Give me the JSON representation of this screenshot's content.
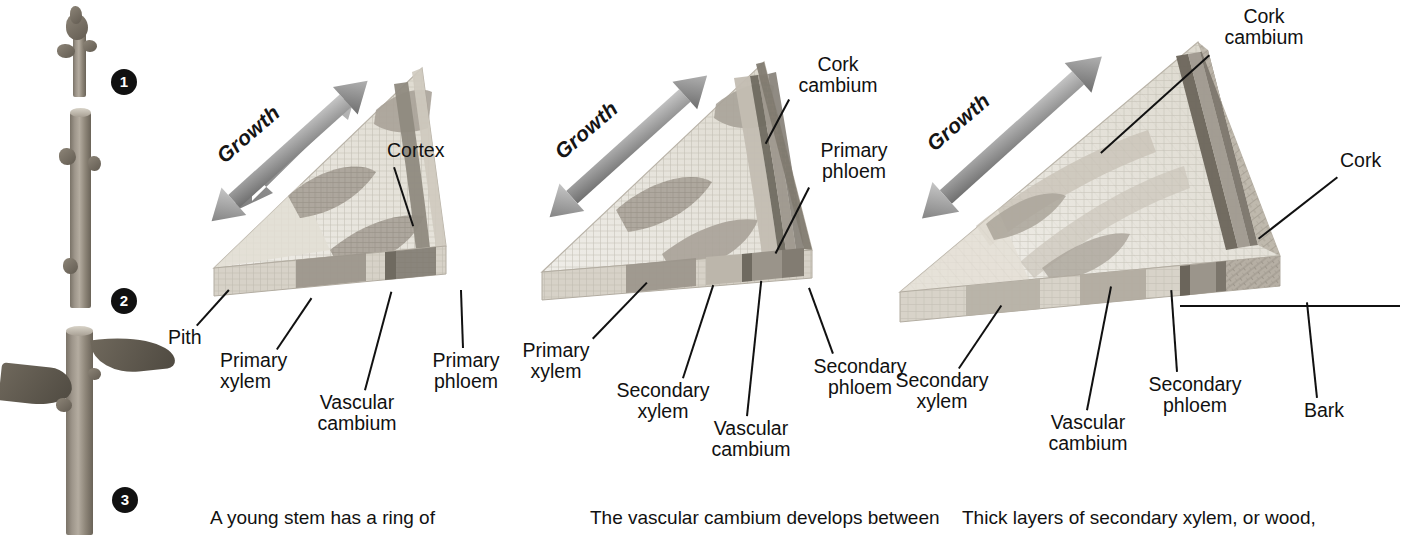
{
  "figure": {
    "palette": {
      "ink": "#111111",
      "arrow_gray": "#8a8a8a",
      "pith": "#d9d5cc",
      "primary_xylem": "#9a958b",
      "secondary_xylem": "#b3ada2",
      "vascular_cambium": "#6f6a60",
      "primary_phloem": "#8e8980",
      "secondary_phloem": "#a39d93",
      "cortex": "#cdc8bf",
      "cork_cambium": "#7c766c",
      "cork": "#b9b2a7",
      "stem_photo": "#8b8377"
    }
  },
  "photo_column": {
    "name": "woody stem growth photographs",
    "stages": [
      {
        "badge": "1",
        "caption_ref": "young twig with terminal bud"
      },
      {
        "badge": "2",
        "caption_ref": "one-year-old stem"
      },
      {
        "badge": "3",
        "caption_ref": "leafy stem segment"
      }
    ]
  },
  "panels": [
    {
      "id": "panel-1",
      "badge": "1",
      "growth_label": "Growth",
      "labels": [
        {
          "key": "cortex",
          "text": "Cortex"
        },
        {
          "key": "pith",
          "text": "Pith"
        },
        {
          "key": "primary_xylem",
          "text": "Primary\nxylem"
        },
        {
          "key": "vascular_cambium",
          "text": "Vascular\ncambium"
        },
        {
          "key": "primary_phloem",
          "text": "Primary\nphloem"
        }
      ],
      "caption": "A young stem has a ring of"
    },
    {
      "id": "panel-2",
      "badge": "2",
      "growth_label": "Growth",
      "labels": [
        {
          "key": "cork_cambium",
          "text": "Cork\ncambium"
        },
        {
          "key": "primary_phloem",
          "text": "Primary\nphloem"
        },
        {
          "key": "primary_xylem",
          "text": "Primary\nxylem"
        },
        {
          "key": "secondary_xylem",
          "text": "Secondary\nxylem"
        },
        {
          "key": "vascular_cambium",
          "text": "Vascular\ncambium"
        },
        {
          "key": "secondary_phloem",
          "text": "Secondary\nphloem"
        }
      ],
      "caption": "The vascular cambium develops between"
    },
    {
      "id": "panel-3",
      "badge": "3",
      "growth_label": "Growth",
      "labels": [
        {
          "key": "cork_cambium",
          "text": "Cork\ncambium"
        },
        {
          "key": "cork",
          "text": "Cork"
        },
        {
          "key": "secondary_xylem",
          "text": "Secondary\nxylem"
        },
        {
          "key": "vascular_cambium",
          "text": "Vascular\ncambium"
        },
        {
          "key": "secondary_phloem",
          "text": "Secondary\nphloem"
        },
        {
          "key": "bark",
          "text": "Bark"
        }
      ],
      "caption": "Thick layers of secondary xylem, or wood,"
    }
  ]
}
